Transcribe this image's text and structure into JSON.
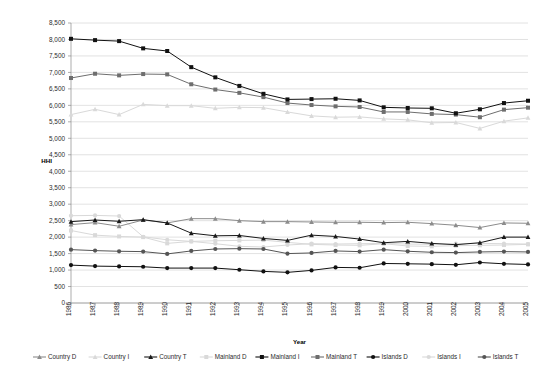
{
  "chart_data": {
    "type": "line",
    "title": "",
    "xlabel": "Year",
    "ylabel": "HHI",
    "ylim": [
      0,
      8500
    ],
    "ytick_step": 500,
    "grid": true,
    "legend_position": "bottom",
    "categories": [
      "1986",
      "1987",
      "1988",
      "1989",
      "1990",
      "1991",
      "1992",
      "1993",
      "1994",
      "1995",
      "1996",
      "1997",
      "1998",
      "1999",
      "2000",
      "2001",
      "2002",
      "2003",
      "2004",
      "2005"
    ],
    "ytick_labels": [
      "0",
      "500",
      "1,000",
      "1,500",
      "2,000",
      "2,500",
      "3,000",
      "3,500",
      "4,000",
      "4,500",
      "5,000",
      "5,500",
      "6,000",
      "6,500",
      "7,000",
      "7,500",
      "8,000",
      "8,500"
    ],
    "series": [
      {
        "name": "Country D",
        "color": "#8c8c8c",
        "marker": "triangle",
        "values": [
          2380,
          2440,
          2330,
          2520,
          2430,
          2560,
          2560,
          2500,
          2470,
          2470,
          2460,
          2450,
          2450,
          2440,
          2450,
          2410,
          2360,
          2290,
          2430,
          2420
        ]
      },
      {
        "name": "Country I",
        "color": "#d9d9d9",
        "marker": "triangle",
        "values": [
          5720,
          5880,
          5720,
          6030,
          5990,
          5990,
          5910,
          5940,
          5930,
          5800,
          5680,
          5640,
          5650,
          5590,
          5560,
          5470,
          5480,
          5300,
          5520,
          5620
        ]
      },
      {
        "name": "Country T",
        "color": "#1a1a1a",
        "marker": "triangle",
        "values": [
          2470,
          2520,
          2480,
          2530,
          2430,
          2120,
          2040,
          2050,
          1960,
          1900,
          2060,
          2020,
          1940,
          1830,
          1870,
          1810,
          1770,
          1830,
          2000,
          2000
        ]
      },
      {
        "name": "Mainland D",
        "color": "#d9d9d9",
        "marker": "square",
        "values": [
          2200,
          2060,
          2020,
          2000,
          1810,
          1870,
          1890,
          1900,
          1910,
          1840,
          1780,
          1760,
          1750,
          1800,
          1730,
          1720,
          1740,
          1750,
          1760,
          1780
        ]
      },
      {
        "name": "Mainland I",
        "color": "#111111",
        "marker": "square",
        "values": [
          8020,
          7980,
          7950,
          7730,
          7650,
          7160,
          6850,
          6590,
          6350,
          6180,
          6190,
          6200,
          6150,
          5940,
          5920,
          5910,
          5760,
          5880,
          6070,
          6140
        ]
      },
      {
        "name": "Mainland T",
        "color": "#6e6e6e",
        "marker": "square",
        "values": [
          6830,
          6960,
          6910,
          6950,
          6940,
          6640,
          6480,
          6380,
          6250,
          6070,
          6010,
          5970,
          5950,
          5800,
          5800,
          5740,
          5720,
          5640,
          5870,
          5930
        ]
      },
      {
        "name": "Islands D",
        "color": "#111111",
        "marker": "circle",
        "values": [
          1150,
          1120,
          1110,
          1100,
          1060,
          1060,
          1060,
          1010,
          960,
          930,
          990,
          1080,
          1070,
          1200,
          1190,
          1180,
          1160,
          1230,
          1190,
          1170
        ]
      },
      {
        "name": "Islands I",
        "color": "#d9d9d9",
        "marker": "circle",
        "values": [
          2650,
          2660,
          2640,
          2010,
          1920,
          1870,
          1800,
          1720,
          1700,
          1760,
          1800,
          1790,
          1800,
          1810,
          1790,
          1780,
          1800,
          1810,
          1800,
          1790
        ]
      },
      {
        "name": "Islands T",
        "color": "#555555",
        "marker": "circle",
        "values": [
          1620,
          1590,
          1570,
          1560,
          1490,
          1580,
          1640,
          1650,
          1640,
          1500,
          1520,
          1580,
          1560,
          1620,
          1570,
          1540,
          1530,
          1550,
          1560,
          1550
        ]
      }
    ]
  },
  "legend": {
    "items": [
      "Country D",
      "Country I",
      "Country T",
      "Mainland D",
      "Mainland I",
      "Mainland T",
      "Islands D",
      "Islands I",
      "Islands T"
    ]
  }
}
